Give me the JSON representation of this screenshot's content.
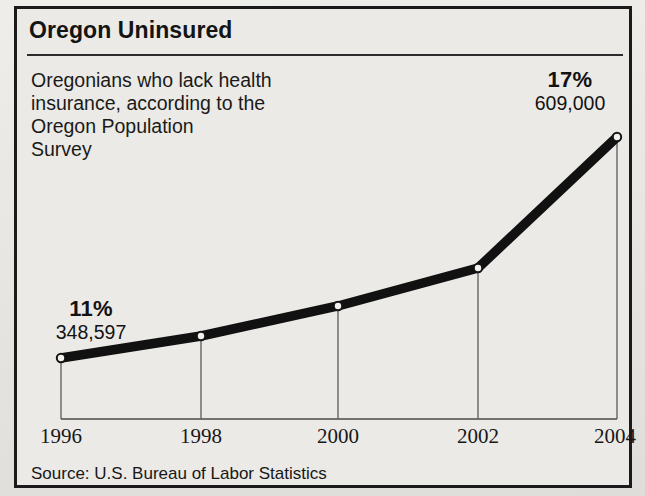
{
  "title": "Oregon Uninsured",
  "description_lines": [
    "Oregonians who lack health",
    "insurance, according to the",
    "Oregon Population",
    "Survey"
  ],
  "callouts": {
    "start": {
      "percent": "11%",
      "count": "348,597"
    },
    "end": {
      "percent": "17%",
      "count": "609,000"
    }
  },
  "source": "Source: U.S. Bureau of Labor Statistics",
  "colors": {
    "paper": "#e9e8e4",
    "panel": "#eceae6",
    "ink": "#141414",
    "line": "#111111",
    "axis": "#4a4a4a",
    "marker_fill": "#f2f1ee"
  },
  "chart_data": {
    "type": "line",
    "title": "Oregon Uninsured",
    "subtitle": "Oregonians who lack health insurance, according to the Oregon Population Survey",
    "xlabel": "",
    "ylabel": "",
    "categories": [
      "1996",
      "1998",
      "2000",
      "2002",
      "2004"
    ],
    "series": [
      {
        "name": "Oregon uninsured",
        "values": [
          348597,
          393000,
          445000,
          505000,
          609000
        ],
        "percent_values": [
          11,
          12,
          13.2,
          14.3,
          17
        ],
        "point_labels": [
          "348,597",
          "",
          "",
          "",
          "609,000"
        ]
      }
    ],
    "annotations": [
      {
        "at": "1996",
        "percent": "11%",
        "count": "348,597"
      },
      {
        "at": "2004",
        "percent": "17%",
        "count": "609,000"
      }
    ],
    "axis_baseline_value": 0,
    "ylim": [
      0,
      700000
    ],
    "grid": false,
    "legend": false,
    "source": "Source: U.S. Bureau of Labor Statistics",
    "marker": "open-circle",
    "line_style": "thick-solid-black",
    "drop_lines": true,
    "pixel_points": [
      {
        "x": 44,
        "y": 349
      },
      {
        "x": 184,
        "y": 327
      },
      {
        "x": 321,
        "y": 297
      },
      {
        "x": 461,
        "y": 259
      },
      {
        "x": 600,
        "y": 128
      }
    ],
    "pixel_baseline_y": 410
  }
}
